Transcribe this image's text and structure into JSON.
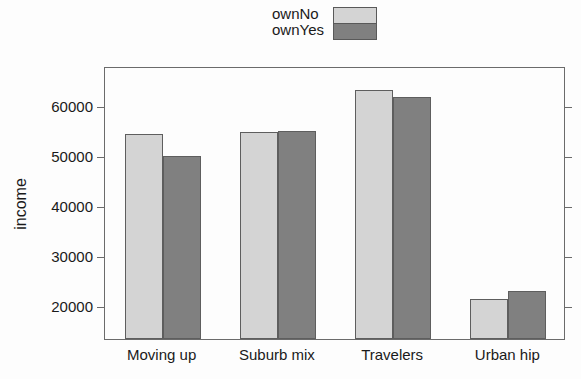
{
  "chart_data": {
    "type": "bar",
    "title": "",
    "xlabel": "",
    "ylabel": "income",
    "categories": [
      "Moving up",
      "Suburb mix",
      "Travelers",
      "Urban hip"
    ],
    "series": [
      {
        "name": "ownNo",
        "color": "#d4d4d4",
        "values": [
          54400,
          54800,
          63300,
          21400
        ]
      },
      {
        "name": "ownYes",
        "color": "#808080",
        "values": [
          50000,
          55100,
          61800,
          23000
        ]
      }
    ],
    "ylim": [
      13500,
      68000
    ],
    "yticks": [
      20000,
      30000,
      40000,
      50000,
      60000
    ],
    "ytick_labels": [
      "20000",
      "30000",
      "40000",
      "50000",
      "60000"
    ],
    "grid": false,
    "legend_position": "top-center",
    "frame": true
  },
  "legend": {
    "entries": [
      {
        "label": "ownNo",
        "color": "#d4d4d4"
      },
      {
        "label": "ownYes",
        "color": "#808080"
      }
    ]
  },
  "axes": {
    "y_title": "income"
  }
}
